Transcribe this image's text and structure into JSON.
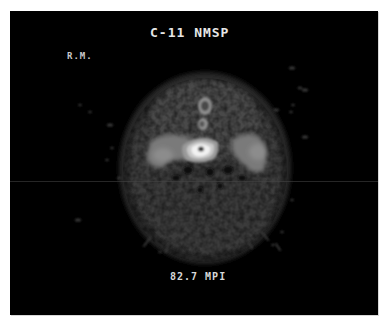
{
  "image": {
    "title": "C-11 NMSP",
    "patient_initials": "R.M.",
    "caption": "82.7 MPI",
    "description": "Axial PET brain scan slice with C-11 NMSP tracer, grayscale on black background",
    "colors": {
      "background": "#000000",
      "border": "#ffffff",
      "text": "#e6e6e6",
      "hotspot": "#f2f2f2",
      "cortex": "#5a5a5a"
    }
  }
}
